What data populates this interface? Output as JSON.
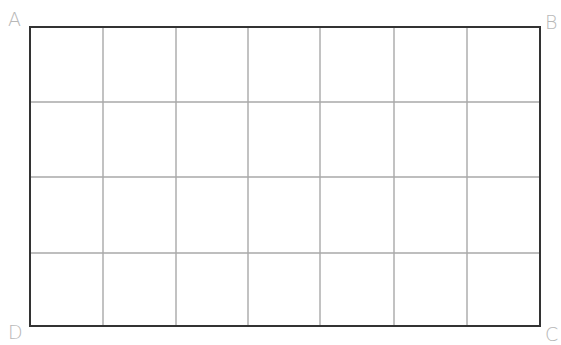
{
  "figure": {
    "type": "rectangle-grid",
    "columns": 7,
    "rows": 4,
    "border_color": "#333333",
    "grid_color": "#a8a8a8",
    "label_color": "#b8b8b8",
    "rect": {
      "left": 30,
      "top": 27,
      "right": 540,
      "bottom": 326
    },
    "column_lines_x": [
      103,
      176,
      248,
      320,
      394,
      467
    ],
    "row_lines_y": [
      102,
      177,
      253
    ]
  },
  "labels": {
    "top_left": "A",
    "top_right": "B",
    "bottom_right": "C",
    "bottom_left": "D"
  }
}
